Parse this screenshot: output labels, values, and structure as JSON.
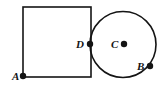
{
  "figure": {
    "name": "square-and-circle-geometry-figure",
    "width": 165,
    "height": 89,
    "background_color": "#ffffff",
    "stroke_color": "#141414",
    "point_color": "#141414",
    "label_color": "#141414"
  },
  "shapes": {
    "square": {
      "name": "square",
      "x": 23,
      "y": 7,
      "width": 68,
      "height": 70
    },
    "circle": {
      "name": "circle",
      "cx": 123,
      "cy": 44.5,
      "r": 33
    }
  },
  "points": {
    "A": {
      "label": "A",
      "cx": 23,
      "cy": 76,
      "r": 3.2,
      "label_x": 12,
      "label_y": 80
    },
    "D": {
      "label": "D",
      "cx": 90,
      "cy": 44,
      "r": 3.2,
      "label_x": 76,
      "label_y": 48
    },
    "C": {
      "label": "C",
      "cx": 124,
      "cy": 44,
      "r": 3.2,
      "label_x": 111,
      "label_y": 48
    },
    "B": {
      "label": "B",
      "cx": 150,
      "cy": 66,
      "r": 3.2,
      "label_x": 137,
      "label_y": 70
    }
  }
}
